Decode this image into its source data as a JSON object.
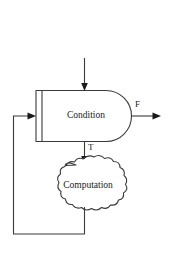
{
  "diagram": {
    "type": "flowchart",
    "background_color": "#ffffff",
    "stroke_color": "#3a3a3a",
    "text_color": "#1a1a1a",
    "nodes": [
      {
        "id": "condition",
        "label": "Condition",
        "shape": "d-shape-rounded-right-with-input-bar",
        "x": 36,
        "y": 90,
        "width": 96,
        "height": 51
      },
      {
        "id": "computation",
        "label": "Computation",
        "shape": "cloud",
        "cx": 88,
        "cy": 185,
        "rx": 40,
        "ry": 25
      }
    ],
    "edges": [
      {
        "id": "entry",
        "label": "",
        "from": "top-entry",
        "to": "condition",
        "direction": "down"
      },
      {
        "id": "false-exit",
        "label": "F",
        "from": "condition",
        "to": "exit",
        "direction": "right"
      },
      {
        "id": "true-branch",
        "label": "T",
        "from": "condition",
        "to": "computation",
        "direction": "down"
      },
      {
        "id": "feedback-loop",
        "label": "",
        "from": "computation",
        "to": "condition",
        "direction": "loop-left"
      }
    ]
  }
}
